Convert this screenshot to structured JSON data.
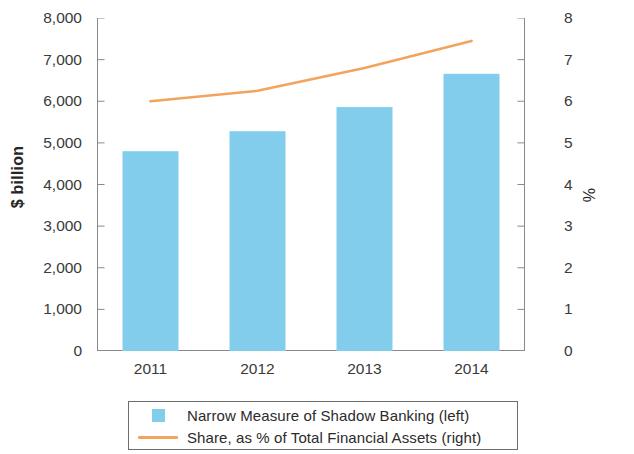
{
  "chart_data": {
    "type": "bar",
    "title": "",
    "subtitle": "",
    "categories": [
      "2011",
      "2012",
      "2013",
      "2014"
    ],
    "series": [
      {
        "name": "Narrow Measure of Shadow Banking (left)",
        "type": "bar",
        "axis": "left",
        "color": "#83CDEC",
        "values": [
          4800,
          5280,
          5860,
          6660
        ]
      },
      {
        "name": "Share, as % of Total Financial Assets (right)",
        "type": "line",
        "axis": "right",
        "color": "#F3A45C",
        "values": [
          6.0,
          6.25,
          6.8,
          7.45
        ]
      }
    ],
    "xlabel": "",
    "ylabel_left": "$ billion",
    "ylabel_right": "%",
    "ylim_left": [
      0,
      8000
    ],
    "ylim_right": [
      0,
      8
    ],
    "ytick_labels_left": [
      "8,000",
      "7,000",
      "6,000",
      "5,000",
      "4,000",
      "3,000",
      "2,000",
      "1,000",
      "0"
    ],
    "ytick_values_left": [
      8000,
      7000,
      6000,
      5000,
      4000,
      3000,
      2000,
      1000,
      0
    ],
    "ytick_labels_right": [
      "8",
      "7",
      "6",
      "5",
      "4",
      "3",
      "2",
      "1",
      "0"
    ],
    "ytick_values_right": [
      8,
      7,
      6,
      5,
      4,
      3,
      2,
      1,
      0
    ],
    "grid": false,
    "legend_position": "bottom"
  },
  "axes": {
    "left_title": "$ billion",
    "right_title": "%"
  },
  "legend": {
    "items": [
      {
        "label": "Narrow Measure of Shadow Banking (left)",
        "key": "bar-swatch-icon",
        "color": "#83CDEC"
      },
      {
        "label": "Share, as % of Total Financial Assets (right)",
        "key": "line-swatch-icon",
        "color": "#F3A45C"
      }
    ]
  },
  "colors": {
    "bar": "#83CDEC",
    "line": "#F3A45C",
    "axis": "#8a8a8a",
    "text": "#2b2b2b",
    "legend_border": "#6d6d6d"
  }
}
